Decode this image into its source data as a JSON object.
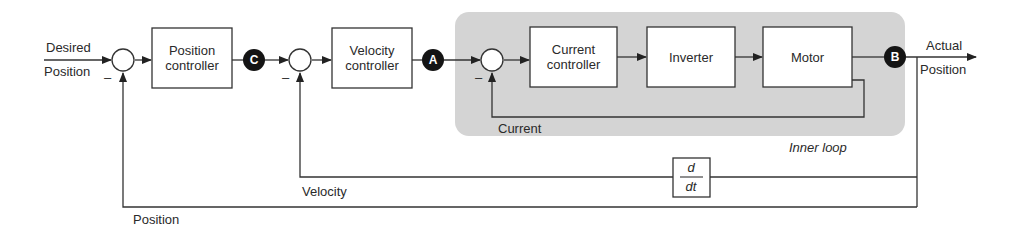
{
  "diagram": {
    "input": {
      "line1": "Desired",
      "line2": "Position"
    },
    "output": {
      "line1": "Actual",
      "line2": "Position"
    },
    "blocks": {
      "position_controller": {
        "line1": "Position",
        "line2": "controller"
      },
      "velocity_controller": {
        "line1": "Velocity",
        "line2": "controller"
      },
      "current_controller": {
        "line1": "Current",
        "line2": "controller"
      },
      "inverter": "Inverter",
      "motor": "Motor",
      "derivative": {
        "numerator": "d",
        "denominator": "dt"
      }
    },
    "nodes": {
      "a": "A",
      "b": "B",
      "c": "C"
    },
    "feedback_labels": {
      "current": "Current",
      "velocity": "Velocity",
      "position": "Position"
    },
    "minus_sign": "–",
    "inner_loop_label": "Inner loop",
    "colors": {
      "inner_loop_fill": "#d4d4d4",
      "line": "#333333",
      "node_fill": "#141414"
    }
  }
}
